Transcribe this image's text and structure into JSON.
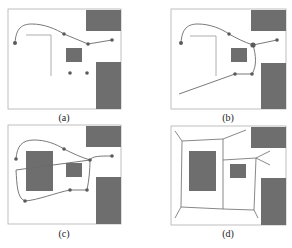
{
  "figure": {
    "panels": [
      {
        "id": "a",
        "label": "(a)",
        "caption_description": "Initial path through waypoints with obstacles"
      },
      {
        "id": "b",
        "label": "(b)",
        "caption_description": "Extended path with additional segment"
      },
      {
        "id": "c",
        "label": "(c)",
        "caption_description": "Closed loop path around central obstacle"
      },
      {
        "id": "d",
        "label": "(d)",
        "caption_description": "Roadmap / skeleton graph of free space"
      }
    ],
    "colors": {
      "obstacle": "#6e6e6e",
      "path": "#6a6a6a",
      "waypoint": "#5a5a5a",
      "frame": "#b0b0b0",
      "wall": "#9a9a9a"
    }
  }
}
